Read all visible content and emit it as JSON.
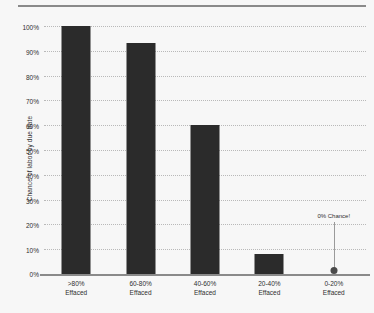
{
  "chart_data": {
    "type": "bar",
    "title": "",
    "xlabel": "",
    "ylabel": "Chance of labor by due date",
    "categories": [
      ">80%\nEffaced",
      "60-80%\nEffaced",
      "40-60%\nEffaced",
      "20-40%\nEffaced",
      "0-20%\nEffaced"
    ],
    "category_lines": [
      [
        ">80%",
        "Effaced"
      ],
      [
        "60-80%",
        "Effaced"
      ],
      [
        "40-60%",
        "Effaced"
      ],
      [
        "20-40%",
        "Effaced"
      ],
      [
        "0-20%",
        "Effaced"
      ]
    ],
    "values": [
      100,
      93,
      60,
      8,
      0
    ],
    "ylim": [
      0,
      100
    ],
    "ytick_labels": [
      "0%",
      "10%",
      "20%",
      "30%",
      "40%",
      "50%",
      "60%",
      "70%",
      "80%",
      "90%",
      "100%"
    ],
    "ytick_values": [
      0,
      10,
      20,
      30,
      40,
      50,
      60,
      70,
      80,
      90,
      100
    ],
    "grid": true,
    "legend": "none",
    "bar_color": "#2b2b2b",
    "gridline_color": "#b9b9b9",
    "axis_color": "#8a8a8a",
    "background_color": "#f7f7f7",
    "annotations": [
      {
        "text": "0% Chance!",
        "category": "0-20%\nEffaced",
        "value": 0,
        "marker": "dot",
        "marker_color": "#4a4a4a"
      }
    ]
  }
}
